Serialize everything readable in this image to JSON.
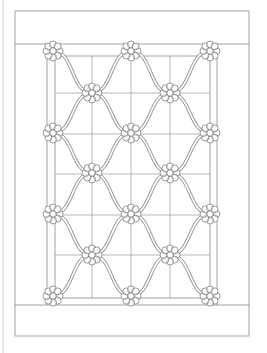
{
  "diagram": {
    "kind": "quilt-pattern",
    "title": "",
    "colors": {
      "line": "#8a8a8a",
      "vine": "#8c8c8c",
      "flower_outline": "#6e6e6e",
      "background": "#ffffff"
    },
    "page_edge_line_x": 3,
    "outer_border": {
      "x": 15,
      "y": 11,
      "width": 234,
      "height": 325
    },
    "top_border_band_bottom_y": 44,
    "bottom_border_band_top_y": 305,
    "inner_frame": {
      "outer_vertical_x": [
        47,
        217
      ],
      "inner_vertical_x": [
        55,
        210
      ],
      "top_y": 56,
      "bottom_y": 298
    },
    "grid": {
      "vertical_x": [
        92,
        131,
        170
      ],
      "horizontal_y": [
        93,
        134,
        174,
        215,
        255
      ]
    },
    "flowers": {
      "petals": 8,
      "radius": 9,
      "center_radius": 3.2,
      "rows": [
        {
          "y": 51,
          "x": [
            53,
            131,
            210
          ]
        },
        {
          "y": 93,
          "x": [
            92,
            170
          ]
        },
        {
          "y": 133,
          "x": [
            53,
            131,
            210
          ]
        },
        {
          "y": 173,
          "x": [
            92,
            170
          ]
        },
        {
          "y": 214,
          "x": [
            53,
            131,
            210
          ]
        },
        {
          "y": 255,
          "x": [
            92,
            170
          ]
        },
        {
          "y": 296,
          "x": [
            53,
            131,
            210
          ]
        }
      ]
    },
    "vines": {
      "style": "double-line band",
      "pattern": "S-curves connecting flowers in alternating rows"
    }
  }
}
